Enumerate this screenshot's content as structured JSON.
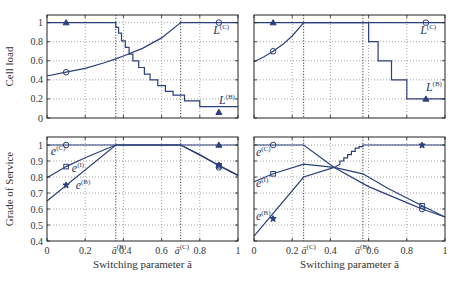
{
  "colors": {
    "line": "#2b3f7a",
    "frame": "#222222",
    "grid": "#666666",
    "text": "#333333"
  },
  "chart_data": [
    {
      "panel": "top-left",
      "type": "line",
      "ylabel": "Cell load",
      "xlabel": "",
      "xlim": [
        0,
        1
      ],
      "ylim": [
        0,
        1.08
      ],
      "yticks": [
        0,
        0.2,
        0.4,
        0.6,
        0.8,
        1
      ],
      "ytick_labels": [
        "0",
        "0.2",
        "0.4",
        "0.6",
        "0.8",
        "1"
      ],
      "xticks": [
        0,
        0.2,
        0.4,
        0.6,
        0.8,
        1
      ],
      "grid": true,
      "vlines": [
        0.36,
        0.7
      ],
      "series": [
        {
          "name": "L^(C)",
          "label": "L",
          "sup": "(C)",
          "label_pos": [
            0.87,
            0.88
          ],
          "marker": "circle",
          "markers": [
            [
              0.1,
              0.48
            ],
            [
              0.9,
              1.0
            ]
          ],
          "x": [
            0,
            0.1,
            0.2,
            0.3,
            0.36,
            0.4,
            0.5,
            0.6,
            0.7,
            1.0
          ],
          "y": [
            0.44,
            0.48,
            0.52,
            0.58,
            0.62,
            0.65,
            0.73,
            0.84,
            1.0,
            1.0
          ]
        },
        {
          "name": "L^(B)",
          "label": "L",
          "sup": "(B)",
          "label_pos": [
            0.9,
            0.15
          ],
          "marker": "triangle",
          "markers": [
            [
              0.1,
              1.0
            ],
            [
              0.9,
              0.06
            ]
          ],
          "step": true,
          "x": [
            0,
            0.36,
            0.36,
            0.375,
            0.375,
            0.39,
            0.39,
            0.41,
            0.41,
            0.43,
            0.43,
            0.45,
            0.45,
            0.48,
            0.48,
            0.51,
            0.51,
            0.54,
            0.54,
            0.58,
            0.58,
            0.62,
            0.62,
            0.66,
            0.66,
            0.72,
            0.72,
            0.8,
            0.8,
            1.0
          ],
          "y": [
            1.0,
            1.0,
            0.95,
            0.95,
            0.89,
            0.89,
            0.81,
            0.81,
            0.74,
            0.74,
            0.67,
            0.67,
            0.6,
            0.6,
            0.53,
            0.53,
            0.46,
            0.46,
            0.4,
            0.4,
            0.34,
            0.34,
            0.28,
            0.28,
            0.24,
            0.24,
            0.18,
            0.18,
            0.12,
            0.12
          ]
        }
      ]
    },
    {
      "panel": "top-right",
      "type": "line",
      "ylabel": "",
      "xlabel": "",
      "xlim": [
        0,
        1
      ],
      "ylim": [
        0,
        1.08
      ],
      "yticks": [
        0,
        0.2,
        0.4,
        0.6,
        0.8,
        1
      ],
      "xticks": [
        0,
        0.2,
        0.4,
        0.6,
        0.8,
        1
      ],
      "grid": true,
      "vlines": [
        0.26,
        0.57
      ],
      "series": [
        {
          "name": "L^(C)",
          "label": "L",
          "sup": "(C)",
          "label_pos": [
            0.87,
            0.88
          ],
          "marker": "circle",
          "markers": [
            [
              0.1,
              0.7
            ],
            [
              0.9,
              1.0
            ]
          ],
          "x": [
            0,
            0.05,
            0.1,
            0.15,
            0.2,
            0.26,
            1.0
          ],
          "y": [
            0.59,
            0.64,
            0.7,
            0.77,
            0.86,
            1.0,
            1.0
          ]
        },
        {
          "name": "L^(B)",
          "label": "L",
          "sup": "(B)",
          "label_pos": [
            0.9,
            0.28
          ],
          "marker": "triangle",
          "markers": [
            [
              0.1,
              1.0
            ],
            [
              0.9,
              0.2
            ]
          ],
          "step": true,
          "x": [
            0,
            0.6,
            0.6,
            0.65,
            0.65,
            0.72,
            0.72,
            0.8,
            0.8,
            1.0
          ],
          "y": [
            1.0,
            1.0,
            0.8,
            0.8,
            0.6,
            0.6,
            0.4,
            0.4,
            0.2,
            0.2
          ]
        }
      ]
    },
    {
      "panel": "bottom-left",
      "type": "line",
      "ylabel": "Grade of Service",
      "xlabel": "Switching parameter ā",
      "xlim": [
        0,
        1
      ],
      "ylim": [
        0.4,
        1.05
      ],
      "yticks": [
        0.4,
        0.5,
        0.6,
        0.7,
        0.8,
        0.9,
        1
      ],
      "ytick_labels": [
        "0.4",
        "0.5",
        "0.6",
        "0.7",
        "0.8",
        "0.9",
        "1"
      ],
      "xticks": [
        0,
        0.2,
        0.4,
        0.6,
        0.8,
        1
      ],
      "xtick_labels": [
        {
          "v": 0,
          "t": "0"
        },
        {
          "v": 0.2,
          "t": "0.2"
        },
        {
          "v": 0.36,
          "t": "ā",
          "sup": "(B)"
        },
        {
          "v": 0.41,
          "t": "0.4"
        },
        {
          "v": 0.6,
          "t": "0.6"
        },
        {
          "v": 0.69,
          "t": "ā",
          "sup": "(C)"
        },
        {
          "v": 0.8,
          "t": "0.8"
        },
        {
          "v": 1,
          "t": "1"
        }
      ],
      "grid": true,
      "vlines": [
        0.36,
        0.7
      ],
      "series": [
        {
          "name": "e^(C)",
          "label": "e",
          "sup": "(C)",
          "label_pos": [
            0.02,
            0.935
          ],
          "marker": "circle",
          "markers": [
            [
              0.1,
              1.0
            ],
            [
              0.9,
              0.86
            ]
          ],
          "x": [
            0,
            0.36,
            0.7,
            1.0
          ],
          "y": [
            1.0,
            1.0,
            1.0,
            1.0
          ]
        },
        {
          "name": "e^(I)",
          "label": "e",
          "sup": "(I)",
          "label_pos": [
            0.13,
            0.83
          ],
          "marker": "square",
          "markers": [
            [
              0.1,
              0.865
            ],
            [
              0.9,
              0.87
            ]
          ],
          "x": [
            0,
            0.1,
            0.2,
            0.3,
            0.36,
            0.7,
            0.8,
            0.9,
            1.0
          ],
          "y": [
            0.795,
            0.865,
            0.92,
            0.97,
            1.0,
            1.0,
            0.94,
            0.87,
            0.81
          ]
        },
        {
          "name": "e^(B)",
          "label": "e",
          "sup": "(B)",
          "label_pos": [
            0.15,
            0.725
          ],
          "marker": "star",
          "markers": [
            [
              0.1,
              0.75
            ],
            [
              0.9,
              0.875
            ]
          ],
          "x": [
            0,
            0.36,
            0.7,
            1.0
          ],
          "y": [
            0.65,
            1.0,
            1.0,
            0.81
          ]
        }
      ],
      "extra_markers": [
        {
          "shape": "triangle",
          "x": 0.9,
          "y": 1.0
        }
      ]
    },
    {
      "panel": "bottom-right",
      "type": "line",
      "ylabel": "",
      "xlabel": "Switching parameter ā",
      "xlim": [
        0,
        1
      ],
      "ylim": [
        0.4,
        1.05
      ],
      "yticks": [
        0.4,
        0.5,
        0.6,
        0.7,
        0.8,
        0.9,
        1
      ],
      "xticks": [
        0,
        0.2,
        0.4,
        0.6,
        0.8,
        1
      ],
      "xtick_labels": [
        {
          "v": 0,
          "t": "0"
        },
        {
          "v": 0.2,
          "t": "0.2"
        },
        {
          "v": 0.27,
          "t": "ā",
          "sup": "(C)"
        },
        {
          "v": 0.4,
          "t": "0.4"
        },
        {
          "v": 0.55,
          "t": "ā",
          "sup": "(B)"
        },
        {
          "v": 0.62,
          "t": "0.6"
        },
        {
          "v": 0.8,
          "t": "0.8"
        },
        {
          "v": 1,
          "t": "1"
        }
      ],
      "grid": true,
      "vlines": [
        0.26,
        0.57
      ],
      "series": [
        {
          "name": "e^(C)",
          "label": "e",
          "sup": "(C)",
          "label_pos": [
            0.01,
            0.93
          ],
          "marker": "circle",
          "markers": [
            [
              0.1,
              1.0
            ],
            [
              0.88,
              0.6
            ]
          ],
          "x": [
            0,
            0.26,
            0.42,
            0.6,
            0.8,
            0.88,
            1.0
          ],
          "y": [
            1.0,
            1.0,
            0.86,
            0.74,
            0.64,
            0.6,
            0.55
          ]
        },
        {
          "name": "e^(I)",
          "label": "e",
          "sup": "(I)",
          "label_pos": [
            0.01,
            0.735
          ],
          "marker": "square",
          "markers": [
            [
              0.1,
              0.82
            ],
            [
              0.88,
              0.62
            ]
          ],
          "x": [
            0,
            0.1,
            0.26,
            0.42,
            0.57,
            0.7,
            0.88,
            1.0
          ],
          "y": [
            0.77,
            0.82,
            0.88,
            0.86,
            0.82,
            0.73,
            0.62,
            0.55
          ]
        },
        {
          "name": "e^(B)",
          "label": "e",
          "sup": "(B)",
          "label_pos": [
            0.01,
            0.53
          ],
          "marker": "star",
          "markers": [
            [
              0.1,
              0.54
            ],
            [
              0.88,
              1.0
            ]
          ],
          "x": [
            0,
            0.26,
            0.42,
            0.45,
            0.45,
            0.47,
            0.47,
            0.49,
            0.49,
            0.51,
            0.51,
            0.53,
            0.53,
            0.55,
            0.55,
            0.57,
            0.57,
            1.0
          ],
          "y": [
            0.43,
            0.8,
            0.86,
            0.88,
            0.9,
            0.9,
            0.92,
            0.92,
            0.94,
            0.94,
            0.96,
            0.96,
            0.98,
            0.98,
            0.99,
            0.99,
            1.0,
            1.0
          ]
        }
      ]
    }
  ],
  "layout": {
    "panels": [
      {
        "x0": 47,
        "x1": 238,
        "y0": 15,
        "y1": 118
      },
      {
        "x0": 254,
        "x1": 445,
        "y0": 15,
        "y1": 118
      },
      {
        "x0": 47,
        "x1": 238,
        "y0": 137,
        "y1": 241
      },
      {
        "x0": 254,
        "x1": 445,
        "y0": 137,
        "y1": 241
      }
    ]
  }
}
